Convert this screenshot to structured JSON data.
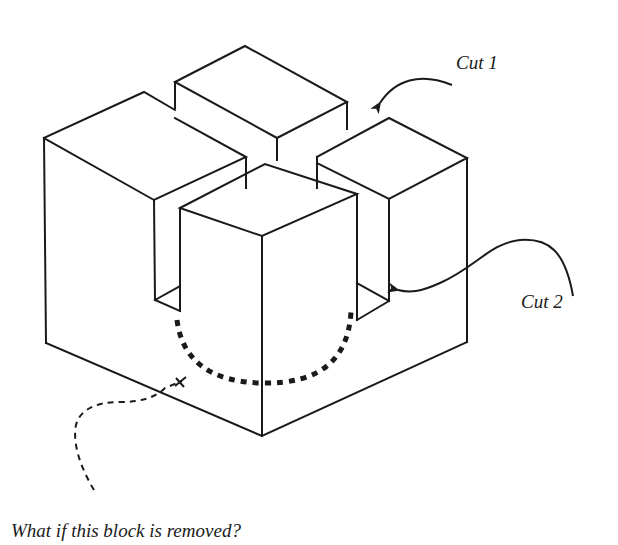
{
  "diagram": {
    "type": "isometric-block-illustration",
    "stroke_color": "#1a1a1a",
    "background": "#ffffff",
    "labels": {
      "cut1": "Cut 1",
      "cut2": "Cut 2",
      "question": "What if this block is removed?"
    },
    "elements": [
      {
        "id": "back-block",
        "description": "Rear column (top)"
      },
      {
        "id": "left-block",
        "description": "Left column"
      },
      {
        "id": "right-block",
        "description": "Right column"
      },
      {
        "id": "front-block",
        "description": "Front column, indicated for removal"
      },
      {
        "id": "cut-1-arrow",
        "description": "Arrow pointing to gap between back and right blocks"
      },
      {
        "id": "cut-2-arrow",
        "description": "Wavy arrow pointing to slot between front and right blocks"
      },
      {
        "id": "removal-dashed-arc",
        "description": "Thick dashed arc around base of front block"
      },
      {
        "id": "question-dashed-arrow",
        "description": "Dashed curved arrow from question text to front block"
      }
    ]
  }
}
